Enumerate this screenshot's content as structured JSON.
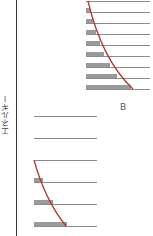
{
  "diagram": {
    "axis_label": "エネルギー",
    "colors": {
      "axis": "#333333",
      "level_line": "#8c8c8c",
      "bar": "#9a9a9a",
      "curve": "#b03a2e",
      "text": "#555555"
    },
    "panels": [
      {
        "id": "B",
        "label": "B",
        "levels_y": [
          1,
          12,
          23,
          34,
          45,
          56,
          67,
          78,
          89
        ],
        "x_start": 86,
        "x_end": 150,
        "bar_widths": [
          0,
          4,
          7,
          10,
          14,
          18,
          24,
          31,
          45
        ],
        "curve": {
          "start": [
            88,
            1
          ],
          "control": [
            102,
            60
          ],
          "end": [
            133,
            89
          ]
        }
      },
      {
        "id": "A",
        "label": "",
        "levels_y": [
          116,
          138,
          160,
          182,
          204,
          226
        ],
        "x_start": 34,
        "x_end": 97,
        "bar_widths": [
          0,
          0,
          0,
          9,
          19,
          33
        ],
        "curve": {
          "start": [
            34,
            160
          ],
          "control": [
            45,
            200
          ],
          "end": [
            66,
            226
          ]
        }
      }
    ],
    "label_B_position": [
      120,
      102
    ]
  }
}
